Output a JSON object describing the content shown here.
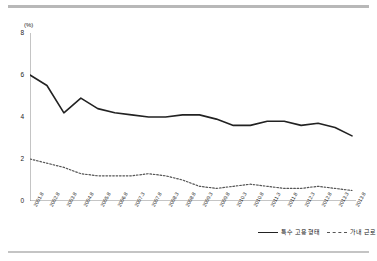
{
  "chart_data": {
    "type": "line",
    "title": "",
    "xlabel": "",
    "ylabel": "(%)",
    "ylim": [
      0,
      8
    ],
    "yticks": [
      0,
      2,
      4,
      6,
      8
    ],
    "grid": false,
    "legend_position": "bottom-right",
    "categories": [
      "2001.8",
      "2002.8",
      "2003.8",
      "2004.8",
      "2005.8",
      "2006.8",
      "2007.3",
      "2007.8",
      "2008.3",
      "2008.8",
      "2009.3",
      "2009.8",
      "2010.3",
      "2010.8",
      "2011.3",
      "2011.8",
      "2012.3",
      "2012.8",
      "2013.3",
      "2013.8"
    ],
    "series": [
      {
        "name": "특수 고용 형태",
        "style": "solid",
        "color": "#222222",
        "values": [
          6.0,
          5.5,
          4.2,
          4.9,
          4.4,
          4.2,
          4.1,
          4.0,
          4.0,
          4.1,
          4.1,
          3.9,
          3.6,
          3.6,
          3.8,
          3.8,
          3.6,
          3.7,
          3.5,
          3.1
        ]
      },
      {
        "name": "가내 근로",
        "style": "dashed",
        "color": "#555555",
        "values": [
          2.0,
          1.8,
          1.6,
          1.3,
          1.2,
          1.2,
          1.2,
          1.3,
          1.2,
          1.0,
          0.7,
          0.6,
          0.7,
          0.8,
          0.7,
          0.6,
          0.6,
          0.7,
          0.6,
          0.5
        ]
      }
    ]
  },
  "legend": {
    "items": [
      {
        "label": "특수 고용 형태"
      },
      {
        "label": "가내 근로"
      }
    ]
  },
  "axis": {
    "y_unit": "(%)"
  }
}
